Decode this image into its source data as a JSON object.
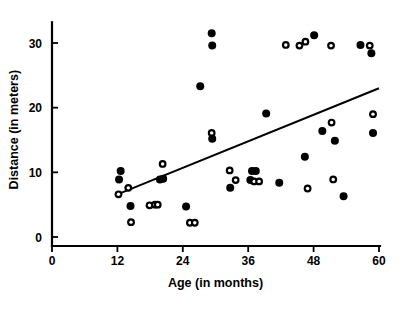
{
  "chart_data": {
    "type": "scatter",
    "title": "",
    "xlabel": "Age (in months)",
    "ylabel": "Distance (in meters)",
    "xlim": [
      0,
      60
    ],
    "ylim": [
      0,
      33
    ],
    "xticks": [
      0,
      12,
      24,
      36,
      48,
      60
    ],
    "xtick_labels": [
      "0",
      "12",
      "24",
      "36",
      "48",
      "60"
    ],
    "yticks": [
      0,
      10,
      20,
      30
    ],
    "ytick_labels": [
      "0",
      "10",
      "20",
      "30"
    ],
    "grid": false,
    "legend": null,
    "series": [
      {
        "name": "filled-markers",
        "marker": "filled-circle",
        "color": "#000000",
        "points": [
          [
            12.3,
            8.9
          ],
          [
            12.6,
            10.2
          ],
          [
            14.4,
            4.8
          ],
          [
            19.8,
            8.9
          ],
          [
            20.4,
            9.0
          ],
          [
            24.6,
            4.7
          ],
          [
            27.2,
            23.3
          ],
          [
            29.3,
            31.5
          ],
          [
            29.4,
            29.6
          ],
          [
            29.4,
            15.2
          ],
          [
            32.7,
            7.6
          ],
          [
            36.4,
            8.8
          ],
          [
            36.7,
            10.2
          ],
          [
            37.4,
            10.2
          ],
          [
            39.3,
            19.1
          ],
          [
            41.7,
            8.4
          ],
          [
            46.4,
            12.4
          ],
          [
            48.1,
            31.2
          ],
          [
            49.6,
            16.4
          ],
          [
            51.9,
            14.9
          ],
          [
            53.5,
            6.3
          ],
          [
            56.6,
            29.7
          ],
          [
            58.6,
            28.4
          ],
          [
            58.9,
            16.1
          ]
        ]
      },
      {
        "name": "open-markers",
        "marker": "open-circle",
        "color": "#000000",
        "points": [
          [
            12.2,
            6.6
          ],
          [
            14.0,
            7.6
          ],
          [
            14.5,
            2.3
          ],
          [
            17.9,
            4.9
          ],
          [
            18.9,
            5.0
          ],
          [
            19.4,
            5.0
          ],
          [
            20.3,
            11.3
          ],
          [
            25.3,
            2.2
          ],
          [
            26.2,
            2.2
          ],
          [
            29.3,
            16.1
          ],
          [
            32.6,
            10.3
          ],
          [
            33.7,
            8.8
          ],
          [
            37.1,
            8.6
          ],
          [
            38.0,
            8.6
          ],
          [
            42.9,
            29.7
          ],
          [
            45.4,
            29.6
          ],
          [
            46.5,
            30.2
          ],
          [
            46.9,
            7.5
          ],
          [
            51.2,
            29.6
          ],
          [
            51.3,
            17.7
          ],
          [
            51.6,
            8.9
          ],
          [
            58.3,
            29.6
          ],
          [
            58.9,
            19.0
          ]
        ]
      }
    ],
    "trend_line": {
      "name": "regression-line",
      "x_start": 12.0,
      "y_start": 6.6,
      "x_end": 60.0,
      "y_end": 23.0,
      "color": "#000000"
    }
  }
}
